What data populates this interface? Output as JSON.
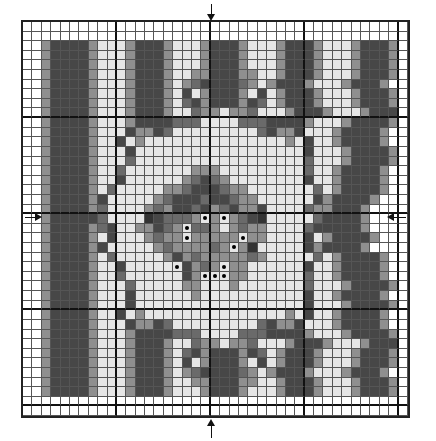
{
  "chart": {
    "type": "cross-stitch-pattern",
    "columns": 41,
    "rows_count": 41,
    "major_grid_every": 10,
    "center_markers": [
      "top-arrow",
      "bottom-arrow",
      "left-arrow",
      "right-arrow"
    ],
    "palette": {
      ".": "#ffffff",
      "l": "#e6e6e6",
      "m": "#8f8f8f",
      "g": "#6a6a6a",
      "d": "#474747",
      "k": "#333333",
      "*": "#e6e6e6"
    },
    "rows": [
      ".........................................",
      ".........................................",
      "..mddddmlllmdddmlllmdddmlllmdddmlllmdddm.",
      "..mddddmlllmdddmlllmdddmlllmdddmlllmdddm.",
      "..mddddmlllmdddmlllmdddmlllmdddmlllmdddm.",
      "..mddddmlllmdddmllmmdddmmllmdddmlllmdddm.",
      "..mddddmlllmdddmlmgddddgmlmdddmlllmdddm..",
      "..mddddmlllmdddmldlmdddmldlmdddmlllmdddm.",
      "..mddddmlllmdddmlgdmdddmdglmdddmlllmdddm.",
      "..mddddmlllmdddmllgmmlmmglllmdddmlllmddd.",
      "..mddddmlllmddddgggllllgggddddmlllmddddm.",
      "..mddddmllldmmdglllllllllgdmmdlllmddddm..",
      "..mddddmlldlmlllllllllllllllmldllmddddm..",
      "..mddddmllldlllllllllllllllllldlllmddddm.",
      "..mddddmlllgllllllllllllllllllglllmddddm.",
      "..mddddmllglllllllmmmlllllllllgllmddddm..",
      "..mddddmlldllllllmgdgmlllllllldllmddddm..",
      "..mddddmlglllllmmgdddgmmlllllllglmddddm..",
      "..mddddmdlllllmgdddgddgmmlllllldmddddm...",
      "..mddddmgllllmgmddgdmgdmmdllllgmmdddm....",
      "..mdddddgllllkdgggm*m*mgdklllllgddddm....",
      "..mddddmgdllmmdgm*ggmlmgmmllllgdddddm....",
      "..mddddmldlllmgmm*mmmmm*mmlllldlmddddm...",
      "..mddddmdlllllmgmmmmgm*mkllllldmddddm....",
      "..mddddmlglllllmdmgmmmmmgmlllllglmddddm..",
      "..mddddmlldlllll*dmgm*mmlllllldllmddddm..",
      "..mddddmllglllllldm***mmllllllgllmddddm..",
      "..mddddmlllglllllmmlllmlllllllglllmddddm.",
      "..mddddmllldllllllmllllllllllldllmddddm..",
      "..mddddmllldlllllllllllllllllldlllmddddm.",
      "..mddddmlldlmlllllllllllllllmldllmddddm..",
      "..mddddmllldmmdglllllllllgdmmdlllmddddm..",
      "..mddddmlllmddddgggllllgggddddmlllmddddm.",
      "..mddddmlllmdddmllgmmlmmglllmdddmlllmddd.",
      "..mddddmlllmdddmlgdmdddmdglmdddmlllmdddm.",
      "..mddddmlllmdddmldlmdddmldlmdddmlllmdddm.",
      "..mddddmlllmdddmlmgddddgmlmdddmlllmdddm..",
      "..mddddmlllmdddmllmmdddmmllmdddmlllmdddm.",
      "..mddddmlllmdddmlllmdddmlllmdddmlllmdddm.",
      ".........................................",
      "........................................."
    ]
  }
}
